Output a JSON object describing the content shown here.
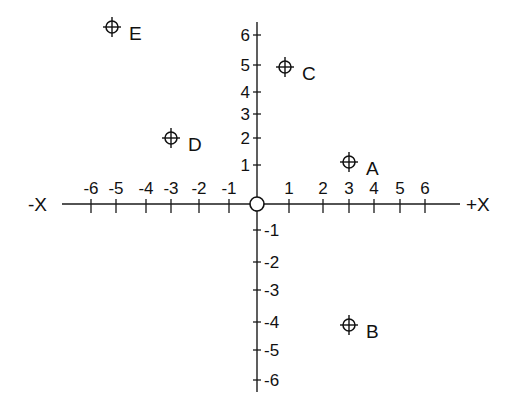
{
  "chart_data": {
    "type": "scatter",
    "title": "",
    "xlabel_negative": "-X",
    "xlabel_positive": "+X",
    "ylabel": "",
    "xlim": [
      -6,
      6
    ],
    "ylim": [
      -6,
      6
    ],
    "grid": false,
    "x_ticks": [
      {
        "label": "-6",
        "value": -6
      },
      {
        "label": "-5",
        "value": -5
      },
      {
        "label": "-4",
        "value": -4
      },
      {
        "label": "-3",
        "value": -3
      },
      {
        "label": "-2",
        "value": -2
      },
      {
        "label": "-1",
        "value": -1
      },
      {
        "label": "1",
        "value": 1
      },
      {
        "label": "2",
        "value": 2
      },
      {
        "label": "3",
        "value": 3
      },
      {
        "label": "4",
        "value": 4
      },
      {
        "label": "5",
        "value": 5
      },
      {
        "label": "6",
        "value": 6
      }
    ],
    "y_ticks": [
      {
        "label": "6",
        "value": 6
      },
      {
        "label": "5",
        "value": 5
      },
      {
        "label": "4",
        "value": 4
      },
      {
        "label": "3",
        "value": 3
      },
      {
        "label": "2",
        "value": 2
      },
      {
        "label": "1",
        "value": 1
      },
      {
        "label": "-1",
        "value": -1
      },
      {
        "label": "-2",
        "value": -2
      },
      {
        "label": "-3",
        "value": -3
      },
      {
        "label": "-4",
        "value": -4
      },
      {
        "label": "-5",
        "value": -5
      },
      {
        "label": "-6",
        "value": -6
      }
    ],
    "origin_marker": true,
    "points": [
      {
        "label": "A",
        "x": 3,
        "y": 1
      },
      {
        "label": "B",
        "x": 3,
        "y": -4
      },
      {
        "label": "C",
        "x": 1,
        "y": 5
      },
      {
        "label": "D",
        "x": -3,
        "y": 2
      },
      {
        "label": "E",
        "x": -5,
        "y": 6
      }
    ]
  },
  "axes": {
    "x_negative_label": "-X",
    "x_positive_label": "+X"
  },
  "ticks": {
    "x": [
      {
        "label": "-6",
        "px": 91
      },
      {
        "label": "-5",
        "px": 116
      },
      {
        "label": "-4",
        "px": 146
      },
      {
        "label": "-3",
        "px": 171
      },
      {
        "label": "-2",
        "px": 199
      },
      {
        "label": "-1",
        "px": 229
      },
      {
        "label": "1",
        "px": 289
      },
      {
        "label": "2",
        "px": 323
      },
      {
        "label": "3",
        "px": 349
      },
      {
        "label": "4",
        "px": 374
      },
      {
        "label": "5",
        "px": 400
      },
      {
        "label": "6",
        "px": 425
      }
    ],
    "y": [
      {
        "label": "6",
        "py": 35
      },
      {
        "label": "5",
        "py": 65
      },
      {
        "label": "4",
        "py": 92
      },
      {
        "label": "3",
        "py": 114
      },
      {
        "label": "2",
        "py": 138
      },
      {
        "label": "1",
        "py": 165
      },
      {
        "label": "-1",
        "py": 230
      },
      {
        "label": "-2",
        "py": 262
      },
      {
        "label": "-3",
        "py": 290
      },
      {
        "label": "-4",
        "py": 322
      },
      {
        "label": "-5",
        "py": 350
      },
      {
        "label": "-6",
        "py": 380
      }
    ]
  },
  "points": [
    {
      "label": "A",
      "px": 349,
      "py": 162
    },
    {
      "label": "B",
      "px": 349,
      "py": 325
    },
    {
      "label": "C",
      "px": 285,
      "py": 67
    },
    {
      "label": "D",
      "px": 171,
      "py": 138
    },
    {
      "label": "E",
      "px": 112,
      "py": 27
    }
  ]
}
